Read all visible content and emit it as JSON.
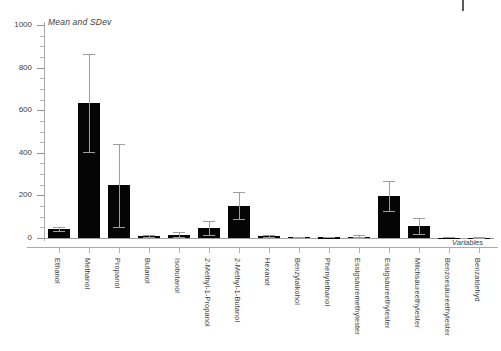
{
  "chart_data": {
    "type": "bar",
    "title": "Mean and SDev",
    "xlabel": "Variables",
    "ylabel": "",
    "ylim": [
      0,
      1000
    ],
    "yticks": [
      0,
      200,
      400,
      600,
      800,
      1000
    ],
    "ytick_labels": [
      "0",
      "200",
      "400",
      "600",
      "800",
      "1000"
    ],
    "minor_tick_step": 50,
    "grid": false,
    "legend": null,
    "orientation": "vertical",
    "error_bars": "SDev",
    "bar_color": "#050505",
    "error_color": "#9c9ea0",
    "axis_color": "#a8aaac",
    "text_color": "#3d4043",
    "categories": [
      "Ethanol",
      "Methanol",
      "Propanol",
      "Butanol",
      "Isobutanol",
      "2-Methyl-1-Propanol",
      "2-Methyl-1-Butanol",
      "Hexanol",
      "Benzylalkohol",
      "Phenylethanol",
      "Essigsäuremethylester",
      "Essigsäureethylester",
      "Milchsäureethylester",
      "Benzoesäureethylester",
      "Benzaldehyd"
    ],
    "values": [
      42,
      635,
      248,
      10,
      16,
      48,
      152,
      8,
      4,
      3,
      7,
      196,
      57,
      2,
      1
    ],
    "errors": [
      10,
      230,
      195,
      6,
      14,
      32,
      62,
      5,
      3,
      2,
      5,
      70,
      38,
      2,
      1
    ],
    "series": [
      {
        "name": "Mean",
        "values": [
          42,
          635,
          248,
          10,
          16,
          48,
          152,
          8,
          4,
          3,
          7,
          196,
          57,
          2,
          1
        ],
        "errors": [
          10,
          230,
          195,
          6,
          14,
          32,
          62,
          5,
          3,
          2,
          5,
          70,
          38,
          2,
          1
        ]
      }
    ]
  },
  "top_marker": {
    "name": "page-rule-tick"
  }
}
